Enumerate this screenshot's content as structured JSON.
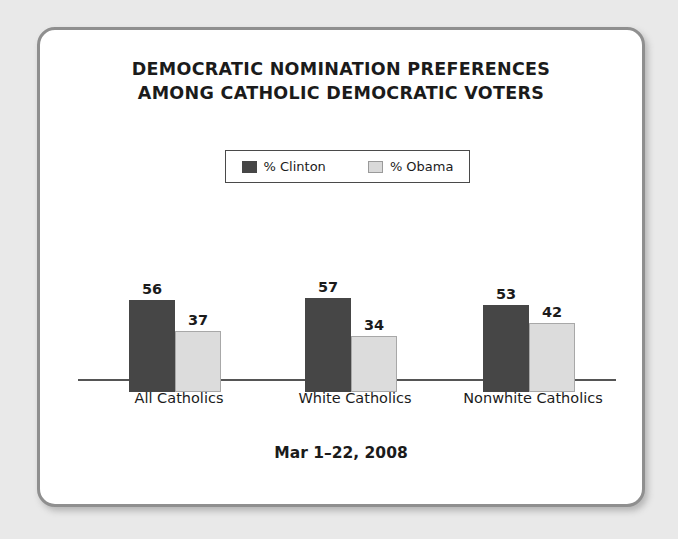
{
  "card": {
    "title_line_1": "DEMOCRATIC NOMINATION PREFERENCES",
    "title_line_2": "AMONG CATHOLIC DEMOCRATIC VOTERS",
    "footer": "Mar 1–22, 2008"
  },
  "legend": {
    "items": [
      {
        "label": "% Clinton",
        "swatch": "dark-swatch-icon",
        "color": "#464646"
      },
      {
        "label": "% Obama",
        "swatch": "light-swatch-icon",
        "color": "#dcdcdc"
      }
    ]
  },
  "chart_data": {
    "type": "bar",
    "title": "DEMOCRATIC NOMINATION PREFERENCES AMONG CATHOLIC DEMOCRATIC VOTERS",
    "subtitle": "Mar 1–22, 2008",
    "categories": [
      "All Catholics",
      "White Catholics",
      "Nonwhite Catholics"
    ],
    "series": [
      {
        "name": "% Clinton",
        "values": [
          56,
          57,
          53
        ],
        "color": "#464646"
      },
      {
        "name": "% Obama",
        "values": [
          37,
          34,
          42
        ],
        "color": "#dcdcdc"
      }
    ],
    "xlabel": "",
    "ylabel": "",
    "ylim": [
      0,
      100
    ],
    "grid": false,
    "legend_position": "top-center",
    "value_labels": true
  }
}
